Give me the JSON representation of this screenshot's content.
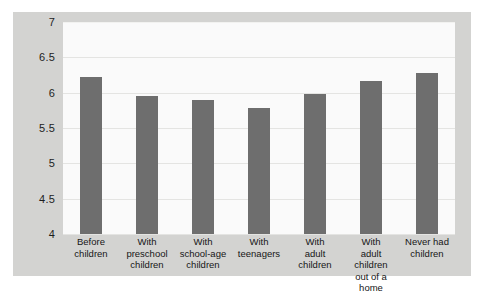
{
  "chart_data": {
    "type": "bar",
    "title": "",
    "subtitle": "",
    "xlabel": "",
    "ylabel": "",
    "ylim": [
      4,
      7
    ],
    "yticks": [
      "7",
      "6.5",
      "6",
      "5.5",
      "5",
      "4.5",
      "4"
    ],
    "ytick_values": [
      7,
      6.5,
      6,
      5.5,
      5,
      4.5,
      4
    ],
    "grid": true,
    "legend": false,
    "legend_position": "none",
    "bar_color": "#6e6e6e",
    "panel_background": "#fafafa",
    "figure_background": "#d3d3d1",
    "categories": [
      "Before children",
      "With preschool children",
      "With school-age children",
      "With teenagers",
      "With adult children",
      "With adult children out of a home",
      "Never had children"
    ],
    "category_lines": [
      [
        "Before",
        "children"
      ],
      [
        "With",
        "preschool",
        "children"
      ],
      [
        "With",
        "school-age",
        "children"
      ],
      [
        "With",
        "teenagers"
      ],
      [
        "With",
        "adult",
        "children"
      ],
      [
        "With",
        "adult children",
        "out of a home"
      ],
      [
        "Never had",
        "children"
      ]
    ],
    "values": [
      6.22,
      5.96,
      5.89,
      5.79,
      5.98,
      6.16,
      6.28
    ]
  }
}
